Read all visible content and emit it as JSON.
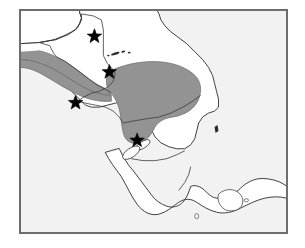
{
  "figure": {
    "type": "distribution-map",
    "region": "Central America",
    "title": "",
    "caption": "",
    "background_color": "#ffffff",
    "frame": {
      "border_color": "#6e6e6e",
      "fill_color": "#f2f2f2",
      "x": 19,
      "y": 9,
      "width": 269,
      "height": 225
    },
    "land_fill_color": "#ffffff",
    "coastline_color": "#2b2b2b",
    "border_color": "#3a3a3a",
    "shading_color": "#8c8c8c",
    "marker_color": "#000000"
  },
  "legend": {
    "shaded_region_label": "shaded distribution range",
    "marker_label": "collection locality (star)"
  },
  "countries": [
    {
      "name": "Mexico"
    },
    {
      "name": "Belize"
    },
    {
      "name": "Guatemala"
    },
    {
      "name": "Honduras"
    },
    {
      "name": "El Salvador"
    },
    {
      "name": "Nicaragua"
    },
    {
      "name": "Costa Rica"
    },
    {
      "name": "Panama"
    }
  ],
  "shaded_ranges": [
    {
      "id": "range-northwest",
      "name": "Chiapas-Guatemala highland band",
      "fill": "#8c8c8c"
    },
    {
      "id": "range-honduras",
      "name": "Honduras-northern Nicaragua block",
      "fill": "#8c8c8c"
    }
  ],
  "markers": [
    {
      "id": "marker-1",
      "name": "star-belize",
      "x": 88,
      "y": 31,
      "symbol": "star"
    },
    {
      "id": "marker-2",
      "name": "star-guatemala-honduras-border",
      "x": 93,
      "y": 66,
      "symbol": "star"
    },
    {
      "id": "marker-3",
      "name": "star-el-salvador-coast",
      "x": 64,
      "y": 95,
      "symbol": "star"
    },
    {
      "id": "marker-4",
      "name": "star-western-nicaragua",
      "x": 125,
      "y": 133,
      "symbol": "star"
    }
  ],
  "water_features": [
    {
      "id": "lake-managua",
      "name": "Lake Managua"
    },
    {
      "id": "lake-nicaragua",
      "name": "Lake Nicaragua"
    }
  ],
  "islands": [
    {
      "id": "bay-islands",
      "name": "Bay Islands of Honduras"
    }
  ]
}
